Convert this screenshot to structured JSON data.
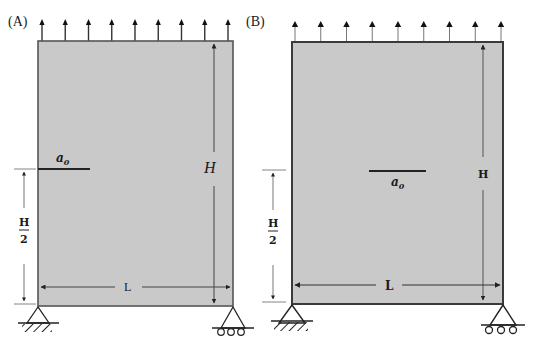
{
  "figure": {
    "colors": {
      "plate_fill": "#c9c9c9",
      "plate_stroke": "#555555",
      "line": "#333333",
      "background": "#ffffff"
    },
    "panels": [
      {
        "id": "A",
        "label": "(A)",
        "height_label": "H",
        "width_label": "L",
        "half_height_num": "H",
        "half_height_den": "2",
        "crack_label": "a",
        "crack_sub": "0",
        "crack_type": "edge",
        "load_arrow_count": 9,
        "supports": [
          "pin",
          "roller"
        ]
      },
      {
        "id": "B",
        "label": "(B)",
        "height_label": "H",
        "width_label": "L",
        "half_height_num": "H",
        "half_height_den": "2",
        "crack_label": "a",
        "crack_sub": "0",
        "crack_type": "center",
        "load_arrow_count": 9,
        "supports": [
          "pin",
          "roller"
        ]
      }
    ]
  }
}
